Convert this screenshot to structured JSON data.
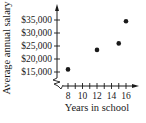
{
  "chart_data": {
    "type": "scatter",
    "title": "",
    "xlabel": "Years in school",
    "ylabel": "Average annual salary",
    "x_ticks": [
      "8",
      "10",
      "12",
      "14",
      "16"
    ],
    "y_ticks": [
      "$15,000",
      "$20,000",
      "$25,000",
      "$30,000",
      "$35,000"
    ],
    "xlim": [
      7,
      17
    ],
    "ylim": [
      13000,
      37000
    ],
    "axis_break": true,
    "grid": false,
    "legend": null,
    "points": [
      {
        "x": 8,
        "y": 16000
      },
      {
        "x": 12,
        "y": 23500
      },
      {
        "x": 15,
        "y": 26000
      },
      {
        "x": 16,
        "y": 34500
      }
    ]
  },
  "colors": {
    "ink": "#1a1a1a",
    "background": "#ffffff"
  }
}
